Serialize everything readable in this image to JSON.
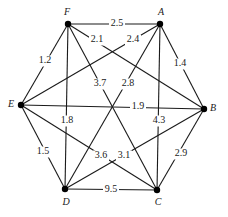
{
  "diagram": {
    "type": "weighted-undirected-graph",
    "nodes": [
      {
        "id": "A",
        "label": "A",
        "x": 160,
        "y": 24,
        "lx": 161,
        "ly": 13
      },
      {
        "id": "B",
        "label": "B",
        "x": 204,
        "y": 109,
        "lx": 213,
        "ly": 109
      },
      {
        "id": "C",
        "label": "C",
        "x": 157,
        "y": 190,
        "lx": 158,
        "ly": 203
      },
      {
        "id": "D",
        "label": "D",
        "x": 65,
        "y": 189,
        "lx": 66,
        "ly": 203
      },
      {
        "id": "E",
        "label": "E",
        "x": 21,
        "y": 105,
        "lx": 11,
        "ly": 105
      },
      {
        "id": "F",
        "label": "F",
        "x": 68,
        "y": 24,
        "lx": 67,
        "ly": 13
      }
    ],
    "edges": [
      {
        "from": "F",
        "to": "A",
        "weight": "2.5",
        "lx": 117,
        "ly": 24
      },
      {
        "from": "F",
        "to": "B",
        "weight": "2.1",
        "lx": 97,
        "ly": 40
      },
      {
        "from": "A",
        "to": "E",
        "weight": "2.4",
        "lx": 133,
        "ly": 40
      },
      {
        "from": "A",
        "to": "B",
        "weight": "1.4",
        "lx": 180,
        "ly": 64
      },
      {
        "from": "F",
        "to": "E",
        "weight": "1.2",
        "lx": 45,
        "ly": 61
      },
      {
        "from": "F",
        "to": "C",
        "weight": "3.7",
        "lx": 100,
        "ly": 84
      },
      {
        "from": "A",
        "to": "D",
        "weight": "2.8",
        "lx": 128,
        "ly": 84
      },
      {
        "from": "E",
        "to": "B",
        "weight": "1.9",
        "lx": 138,
        "ly": 107
      },
      {
        "from": "F",
        "to": "D",
        "weight": "1.8",
        "lx": 67,
        "ly": 121
      },
      {
        "from": "A",
        "to": "C",
        "weight": "4.3",
        "lx": 159,
        "ly": 121
      },
      {
        "from": "E",
        "to": "C",
        "weight": "3.6",
        "lx": 101,
        "ly": 156
      },
      {
        "from": "D",
        "to": "B",
        "weight": "3.1",
        "lx": 124,
        "ly": 156
      },
      {
        "from": "E",
        "to": "D",
        "weight": "1.5",
        "lx": 43,
        "ly": 152
      },
      {
        "from": "B",
        "to": "C",
        "weight": "2.9",
        "lx": 181,
        "ly": 154
      },
      {
        "from": "D",
        "to": "C",
        "weight": "9.5",
        "lx": 111,
        "ly": 190
      }
    ]
  }
}
